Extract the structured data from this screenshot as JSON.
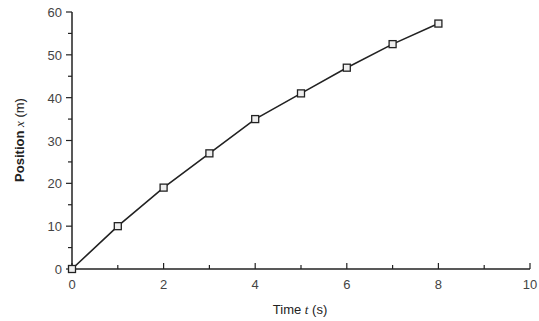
{
  "chart_data": {
    "type": "line",
    "title": "",
    "xlabel": "Time t (s)",
    "ylabel": "Position x (m)",
    "xlim": [
      0,
      10
    ],
    "ylim": [
      0,
      60
    ],
    "xticks": [
      0,
      2,
      4,
      6,
      8,
      10
    ],
    "yticks": [
      0,
      10,
      20,
      30,
      40,
      50,
      60
    ],
    "grid": false,
    "legend": null,
    "marker": "square",
    "series": [
      {
        "name": "position",
        "x": [
          0,
          1,
          2,
          3,
          4,
          5,
          6,
          7,
          8
        ],
        "values": [
          0,
          10,
          19,
          27,
          35,
          41,
          47,
          52.5,
          57.3
        ]
      }
    ]
  },
  "labels": {
    "x_prefix": "Time ",
    "x_var": "t",
    "x_unit": " (s)",
    "y_prefix": "Position ",
    "y_var": "x",
    "y_unit": " (m)"
  }
}
